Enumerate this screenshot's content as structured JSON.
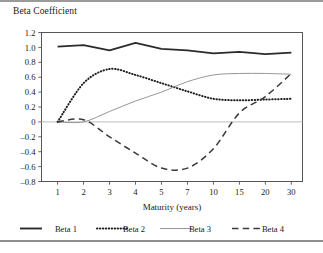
{
  "figure": {
    "title": "Beta Coefficient",
    "has_top_rule": true,
    "has_bottom_rule": true,
    "background": "#ffffff"
  },
  "chart_data": {
    "type": "line",
    "title": "Beta Coefficient",
    "xlabel": "Maturity (years)",
    "ylabel": "",
    "categories": [
      "1",
      "2",
      "3",
      "4",
      "5",
      "7",
      "10",
      "15",
      "20",
      "30"
    ],
    "x": [
      1,
      2,
      3,
      4,
      5,
      7,
      10,
      15,
      20,
      30
    ],
    "yticks": [
      1.2,
      1.0,
      0.8,
      0.6,
      0.4,
      0.2,
      0,
      -0.2,
      -0.4,
      -0.6,
      -0.8
    ],
    "yticklabels": [
      "1.2",
      "1.0",
      "0.8",
      "0.6",
      "0.4",
      "0.2",
      "0",
      "–0.2",
      "–0.4",
      "–0.6",
      "–0.8"
    ],
    "ylim": [
      -0.8,
      1.2
    ],
    "grid": false,
    "zero_line": true,
    "legend_position": "bottom",
    "series": [
      {
        "name": "Beta 1",
        "style": "solid",
        "width": 1.9,
        "color": "#2b2b2b",
        "values": [
          1.01,
          1.03,
          0.96,
          1.06,
          0.98,
          0.96,
          0.92,
          0.94,
          0.91,
          0.93
        ]
      },
      {
        "name": "Beta 2",
        "style": "dotted",
        "width": 2.0,
        "color": "#1f1f1f",
        "values": [
          0.0,
          0.52,
          0.71,
          0.63,
          0.52,
          0.41,
          0.31,
          0.29,
          0.3,
          0.31
        ]
      },
      {
        "name": "Beta 3",
        "style": "solid",
        "width": 0.9,
        "color": "#8a8a8a",
        "values": [
          0.0,
          0.0,
          0.14,
          0.28,
          0.4,
          0.54,
          0.63,
          0.65,
          0.65,
          0.64
        ]
      },
      {
        "name": "Beta 4",
        "style": "dashed",
        "width": 1.5,
        "color": "#3a3a3a",
        "values": [
          0.0,
          0.03,
          -0.2,
          -0.42,
          -0.62,
          -0.62,
          -0.36,
          0.12,
          0.34,
          0.65
        ]
      }
    ]
  },
  "legend": {
    "items": [
      {
        "label": "Beta 1",
        "style": "solid-thick"
      },
      {
        "label": "Beta 2",
        "style": "dotted"
      },
      {
        "label": "Beta 3",
        "style": "solid-thin"
      },
      {
        "label": "Beta 4",
        "style": "dashed"
      }
    ]
  }
}
